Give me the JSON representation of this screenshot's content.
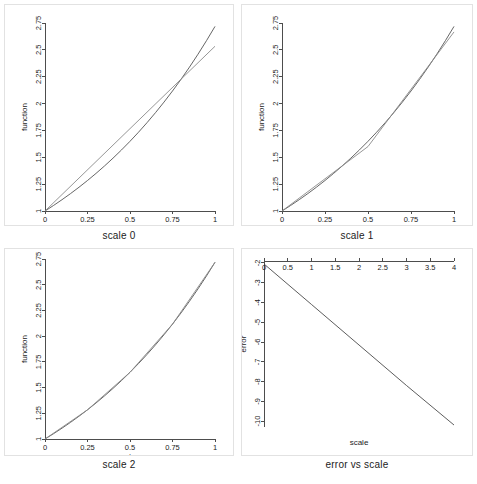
{
  "figure": {
    "width": 477,
    "height": 484,
    "background": "#ffffff",
    "panel_border_color": "#e2e2e2",
    "axis_color": "#4d4d4d",
    "exact_curve_color": "#555555",
    "approx_curve_color": "#8a8a8a"
  },
  "panels": [
    {
      "id": "scale-0",
      "title": "scale 0",
      "xlabel": "t",
      "ylabel": "function"
    },
    {
      "id": "scale-1",
      "title": "scale 1",
      "xlabel": "t",
      "ylabel": "function"
    },
    {
      "id": "scale-2",
      "title": "scale 2",
      "xlabel": "t",
      "ylabel": "function"
    },
    {
      "id": "error-vs-scale",
      "title": "error vs scale",
      "xlabel": "scale",
      "ylabel": "error"
    }
  ],
  "chart_data": [
    {
      "id": "scale-0",
      "type": "line",
      "title": "scale 0",
      "xlabel": "t",
      "ylabel": "function",
      "xlim": [
        0,
        1
      ],
      "ylim": [
        1,
        2.75
      ],
      "xticks": [
        0,
        0.25,
        0.5,
        0.75,
        1
      ],
      "xticklabels": [
        "0",
        "0.25",
        "0.5",
        "0.75",
        "1"
      ],
      "yticks": [
        1,
        1.25,
        1.5,
        1.75,
        2,
        2.25,
        2.5,
        2.75
      ],
      "yticklabels": [
        "1",
        "1.25",
        "1.5",
        "1.75",
        "2",
        "2.25",
        "2.5",
        "2.75"
      ],
      "grid": false,
      "legend": "none",
      "series": [
        {
          "name": "exact",
          "color": "#555555",
          "x": [
            0,
            0.05,
            0.1,
            0.15,
            0.2,
            0.25,
            0.3,
            0.35,
            0.4,
            0.45,
            0.5,
            0.55,
            0.6,
            0.65,
            0.7,
            0.75,
            0.8,
            0.85,
            0.9,
            0.95,
            1
          ],
          "y": [
            1,
            1.0513,
            1.1052,
            1.1618,
            1.2214,
            1.284,
            1.3499,
            1.4191,
            1.4918,
            1.5683,
            1.6487,
            1.7333,
            1.8221,
            1.9155,
            2.0138,
            2.117,
            2.2255,
            2.3396,
            2.4596,
            2.5857,
            2.7183
          ]
        },
        {
          "name": "approximation",
          "color": "#8a8a8a",
          "x": [
            0,
            1
          ],
          "y": [
            1,
            2.5333
          ]
        }
      ]
    },
    {
      "id": "scale-1",
      "type": "line",
      "title": "scale 1",
      "xlabel": "t",
      "ylabel": "function",
      "xlim": [
        0,
        1
      ],
      "ylim": [
        1,
        2.75
      ],
      "xticks": [
        0,
        0.25,
        0.5,
        0.75,
        1
      ],
      "xticklabels": [
        "0",
        "0.25",
        "0.5",
        "0.75",
        "1"
      ],
      "yticks": [
        1,
        1.25,
        1.5,
        1.75,
        2,
        2.25,
        2.5,
        2.75
      ],
      "yticklabels": [
        "1",
        "1.25",
        "1.5",
        "1.75",
        "2",
        "2.25",
        "2.5",
        "2.75"
      ],
      "grid": false,
      "legend": "none",
      "series": [
        {
          "name": "exact",
          "color": "#555555",
          "x": [
            0,
            0.05,
            0.1,
            0.15,
            0.2,
            0.25,
            0.3,
            0.35,
            0.4,
            0.45,
            0.5,
            0.55,
            0.6,
            0.65,
            0.7,
            0.75,
            0.8,
            0.85,
            0.9,
            0.95,
            1
          ],
          "y": [
            1,
            1.0513,
            1.1052,
            1.1618,
            1.2214,
            1.284,
            1.3499,
            1.4191,
            1.4918,
            1.5683,
            1.6487,
            1.7333,
            1.8221,
            1.9155,
            2.0138,
            2.117,
            2.2255,
            2.3396,
            2.4596,
            2.5857,
            2.7183
          ]
        },
        {
          "name": "approximation",
          "color": "#8a8a8a",
          "x": [
            0,
            0.5,
            1
          ],
          "y": [
            1,
            1.6,
            2.6667
          ]
        }
      ]
    },
    {
      "id": "scale-2",
      "type": "line",
      "title": "scale 2",
      "xlabel": "t",
      "ylabel": "function",
      "xlim": [
        0,
        1
      ],
      "ylim": [
        1,
        2.75
      ],
      "xticks": [
        0,
        0.25,
        0.5,
        0.75,
        1
      ],
      "xticklabels": [
        "0",
        "0.25",
        "0.5",
        "0.75",
        "1"
      ],
      "yticks": [
        1,
        1.25,
        1.5,
        1.75,
        2,
        2.25,
        2.5,
        2.75
      ],
      "yticklabels": [
        "1",
        "1.25",
        "1.5",
        "1.75",
        "2",
        "2.25",
        "2.5",
        "2.75"
      ],
      "grid": false,
      "legend": "none",
      "series": [
        {
          "name": "exact",
          "color": "#555555",
          "x": [
            0,
            0.05,
            0.1,
            0.15,
            0.2,
            0.25,
            0.3,
            0.35,
            0.4,
            0.45,
            0.5,
            0.55,
            0.6,
            0.65,
            0.7,
            0.75,
            0.8,
            0.85,
            0.9,
            0.95,
            1
          ],
          "y": [
            1,
            1.0513,
            1.1052,
            1.1618,
            1.2214,
            1.284,
            1.3499,
            1.4191,
            1.4918,
            1.5683,
            1.6487,
            1.7333,
            1.8221,
            1.9155,
            2.0138,
            2.117,
            2.2255,
            2.3396,
            2.4596,
            2.5857,
            2.7183
          ]
        },
        {
          "name": "approximation",
          "color": "#8a8a8a",
          "x": [
            0,
            0.25,
            0.5,
            0.75,
            1
          ],
          "y": [
            1,
            1.2835,
            1.6483,
            2.1164,
            2.7174
          ]
        }
      ]
    },
    {
      "id": "error-vs-scale",
      "type": "line",
      "title": "error vs scale",
      "xlabel": "scale",
      "ylabel": "error",
      "xlim": [
        0,
        4
      ],
      "ylim": [
        -10.3,
        -1.9
      ],
      "xaxis_position": "top",
      "xticks": [
        0,
        0.5,
        1,
        1.5,
        2,
        2.5,
        3,
        3.5,
        4
      ],
      "xticklabels": [
        "0",
        "0.5",
        "1",
        "1.5",
        "2",
        "2.5",
        "3",
        "3.5",
        "4"
      ],
      "yticks": [
        -2,
        -3,
        -4,
        -5,
        -6,
        -7,
        -8,
        -9,
        -10
      ],
      "yticklabels": [
        "-2",
        "-3",
        "-4",
        "-5",
        "-6",
        "-7",
        "-8",
        "-9",
        "-10"
      ],
      "grid": false,
      "legend": "none",
      "series": [
        {
          "name": "error",
          "color": "#4a4a4a",
          "x": [
            0,
            1,
            2,
            3,
            4
          ],
          "y": [
            -2.05,
            -4.1,
            -6.15,
            -8.2,
            -10.2
          ]
        }
      ]
    }
  ]
}
